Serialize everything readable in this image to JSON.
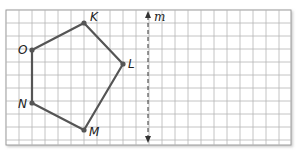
{
  "diagram": {
    "type": "grid-reflection",
    "grid": {
      "x0": 6,
      "y0": 10,
      "cell": 13,
      "cols": 22,
      "rows": 10.4,
      "line_color": "#b5b5b5",
      "border_color": "#9a9a9a"
    },
    "polygon": {
      "name": "pentagon KLMNO",
      "stroke": "#555555",
      "vertices": [
        {
          "label": "K",
          "x": 84,
          "y": 23
        },
        {
          "label": "L",
          "x": 123,
          "y": 64
        },
        {
          "label": "M",
          "x": 84,
          "y": 130
        },
        {
          "label": "N",
          "x": 32,
          "y": 103
        },
        {
          "label": "O",
          "x": 32,
          "y": 50
        }
      ]
    },
    "line_m": {
      "label": "m",
      "x": 148,
      "y_top": 11,
      "y_bottom": 143,
      "style": "dashed, double-arrow"
    }
  }
}
